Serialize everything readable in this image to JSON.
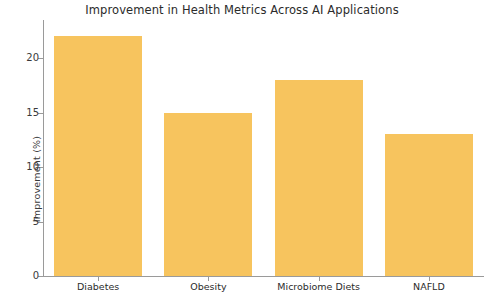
{
  "chart_data": {
    "type": "bar",
    "title": "Improvement in Health Metrics Across AI Applications",
    "xlabel": "",
    "ylabel": "Improvement (%)",
    "categories": [
      "Diabetes",
      "Obesity",
      "Microbiome Diets",
      "NAFLD"
    ],
    "values": [
      22,
      15,
      18,
      13
    ],
    "ylim": [
      0,
      23.5
    ],
    "yticks": [
      0,
      5,
      10,
      15,
      20
    ],
    "ytick_labels": [
      "0",
      "5",
      "10",
      "15",
      "20"
    ],
    "grid": false,
    "legend": null,
    "bar_color": "#f7c45e",
    "axis_color": "#9a9a9a",
    "background_color": "#ffffff",
    "text_color": "#2b2b2b"
  }
}
